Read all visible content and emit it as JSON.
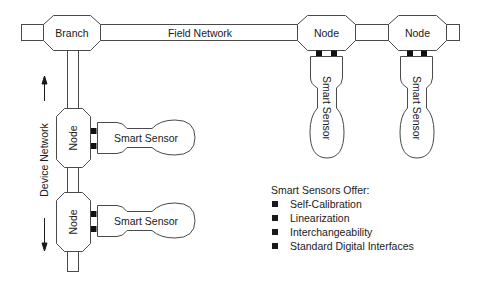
{
  "diagram": {
    "field_network": {
      "label": "Field Network",
      "branch_label": "Branch",
      "nodes": [
        {
          "label": "Node"
        },
        {
          "label": "Node"
        }
      ]
    },
    "device_network": {
      "label": "Device Network",
      "nodes": [
        {
          "label": "Node"
        },
        {
          "label": "Node"
        }
      ]
    },
    "sensors": {
      "field_sensor_1": "Smart Sensor",
      "field_sensor_2": "Smart Sensor",
      "device_sensor_1": "Smart Sensor",
      "device_sensor_2": "Smart Sensor"
    },
    "colors": {
      "stroke": "#4a4a4a",
      "text": "#1a1a1a",
      "connector": "#111111",
      "background": "#ffffff"
    }
  },
  "legend": {
    "heading": "Smart Sensors Offer:",
    "items": [
      "Self-Calibration",
      "Linearization",
      "Interchangeability",
      "Standard Digital Interfaces"
    ]
  }
}
